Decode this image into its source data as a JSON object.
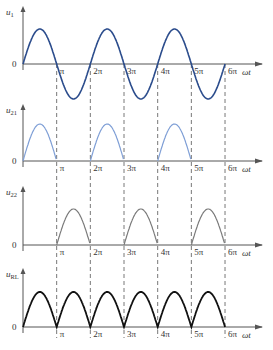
{
  "diagram": {
    "type": "full-wave rectifier waveforms",
    "x_axis_label": "ωt",
    "origin_label": "0",
    "tick_labels": [
      "π",
      "2π",
      "3π",
      "4π",
      "5π",
      "6π"
    ],
    "panels": [
      {
        "id": "u1",
        "y_label": "u",
        "y_sub": "1",
        "waveform": "sine",
        "color": "#2b4c8c",
        "stroke_width": 1.6
      },
      {
        "id": "u21",
        "y_label": "u",
        "y_sub": "21",
        "waveform": "positive half-cycles (0–π, 2π–3π, 4π–5π)",
        "color": "#7f9fd6",
        "stroke_width": 1.2
      },
      {
        "id": "u22",
        "y_label": "u",
        "y_sub": "22",
        "waveform": "positive half-cycles (π–2π, 3π–4π, 5π–6π)",
        "color": "#7a7a7a",
        "stroke_width": 1.2
      },
      {
        "id": "uRL",
        "y_label": "u",
        "y_sub": "RL",
        "waveform": "full-wave rectified",
        "color": "#111111",
        "stroke_width": 1.8
      }
    ]
  }
}
